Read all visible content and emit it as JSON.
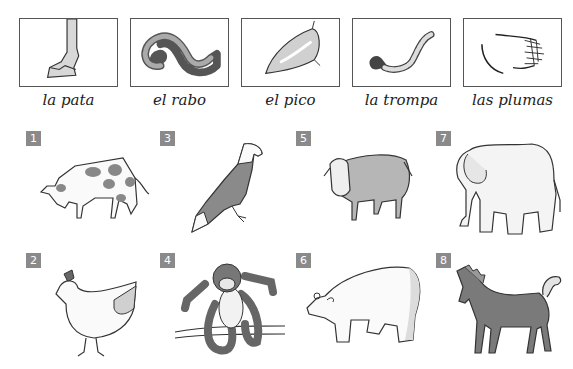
{
  "body_parts": [
    {
      "id": "pata",
      "label": "la pata",
      "icon": "hoof-icon"
    },
    {
      "id": "rabo",
      "label": "el rabo",
      "icon": "tail-icon"
    },
    {
      "id": "pico",
      "label": "el pico",
      "icon": "beak-icon"
    },
    {
      "id": "trompa",
      "label": "la trompa",
      "icon": "trunk-icon"
    },
    {
      "id": "plumas",
      "label": "las plumas",
      "icon": "feathers-icon"
    }
  ],
  "animals": [
    {
      "number": "1",
      "name": "cow"
    },
    {
      "number": "2",
      "name": "hen"
    },
    {
      "number": "3",
      "name": "eagle"
    },
    {
      "number": "4",
      "name": "monkey"
    },
    {
      "number": "5",
      "name": "sheep"
    },
    {
      "number": "6",
      "name": "polar-bear"
    },
    {
      "number": "7",
      "name": "elephant"
    },
    {
      "number": "8",
      "name": "horse"
    }
  ],
  "colors": {
    "badge": "#8a8a8a",
    "box_border": "#555555",
    "fill_dark": "#8c8c8c",
    "fill_light": "#d4d4d4"
  }
}
